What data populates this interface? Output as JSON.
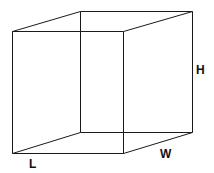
{
  "diagram": {
    "type": "wireframe-box",
    "stroke_color": "#1a1a1a",
    "background_color": "#ffffff",
    "vertices": {
      "front_top_left": [
        12.5,
        31.5
      ],
      "front_top_right": [
        123.5,
        31.5
      ],
      "front_bottom_left": [
        12.5,
        153.5
      ],
      "front_bottom_right": [
        123.5,
        153.5
      ],
      "back_top_left": [
        80.5,
        11.5
      ],
      "back_top_right": [
        192.5,
        11.5
      ],
      "back_bottom_left": [
        80.5,
        132.5
      ],
      "back_bottom_right": [
        192.5,
        132.5
      ]
    },
    "labels": {
      "length": "L",
      "width": "W",
      "height": "H"
    }
  }
}
